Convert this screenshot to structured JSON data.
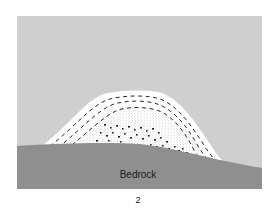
{
  "diagram": {
    "title": "",
    "figure_number": "2",
    "labels": {
      "bedrock": "Bedrock"
    },
    "colors": {
      "background": "#ffffff",
      "sky": "#cfcfcf",
      "bedrock": "#8f8f8f",
      "deposit": "#ffffff",
      "dashes": "#2a2a2a",
      "stipple": "#6a6a6a",
      "pebbles": "#222222"
    },
    "elements": [
      {
        "name": "sky-panel",
        "description": "light gray background panel"
      },
      {
        "name": "glacial-deposit-mound",
        "description": "white dome-shaped deposit with layered dashes, fine stipple core and coarse pebbles at base"
      },
      {
        "name": "bedrock-layer",
        "description": "dark gray undulating bedrock surface"
      }
    ]
  }
}
